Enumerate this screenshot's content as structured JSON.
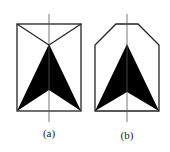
{
  "figures": [
    {
      "id": "a",
      "label": "(a)",
      "outline": "rectangle",
      "description": "Rectangle with diagonal lines from top corners to arrow apex; black arrowhead pointing up along vertical axis"
    },
    {
      "id": "b",
      "label": "(b)",
      "outline": "chamfered-top hexagon",
      "description": "Pentagonal/chamfered outline; black arrowhead pointing up along vertical axis"
    }
  ],
  "colors": {
    "stroke": "#222222",
    "fill": "#000000",
    "axis": "#555555",
    "background": "#ffffff"
  }
}
